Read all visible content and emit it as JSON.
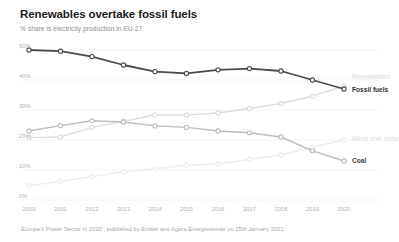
{
  "header": {
    "title": "Renewables overtake fossil fuels",
    "subtitle": "% share is electricity production in EU-27"
  },
  "footnote": {
    "text": "‚Europe's Power Sector in 2020“, published by Ember and Agora Energiewende on 25th January 2021."
  },
  "labels": {
    "fossil": "Fossil fuels",
    "coal": "Coal",
    "renewables": "Renewables",
    "wind_solar": "Wind and solar"
  },
  "colors": {
    "fossil": "#4a4a4a",
    "coal": "#bdbdbd",
    "renewables": "#dcdcdc",
    "wind_solar": "#ececec",
    "grid": "#f0f0f0",
    "axis_text": "#b2b2b2",
    "title": "#1b1b1b",
    "subtitle": "#8e8e8e"
  },
  "chart_data": {
    "type": "line",
    "title": "Renewables overtake fossil fuels",
    "subtitle": "% share is electricity production in EU-27",
    "xlabel": "",
    "ylabel": "% share is electricity production in EU-27",
    "x": [
      "2010",
      "2011",
      "2012",
      "2013",
      "2014",
      "2015",
      "2016",
      "2017",
      "2018",
      "2019",
      "2020"
    ],
    "ylim": [
      0,
      50
    ],
    "yticks": [
      0,
      10,
      20,
      30,
      40,
      50
    ],
    "ytick_labels": [
      "0%",
      "10%",
      "20%",
      "30%",
      "40%",
      "50%"
    ],
    "grid": true,
    "legend": "right-inline",
    "series": [
      {
        "name": "Fossil fuels",
        "color": "#4a4a4a",
        "values": [
          50.0,
          49.6,
          47.8,
          45.0,
          42.8,
          42.2,
          43.4,
          43.8,
          43.0,
          40.0,
          37.0
        ]
      },
      {
        "name": "Renewables",
        "color": "#dcdcdc",
        "values": [
          20.8,
          21.0,
          24.2,
          26.2,
          28.4,
          28.3,
          29.0,
          30.5,
          32.2,
          34.6,
          38.0
        ]
      },
      {
        "name": "Coal",
        "color": "#bdbdbd",
        "values": [
          23.0,
          24.8,
          26.4,
          26.0,
          24.7,
          24.2,
          23.0,
          22.4,
          21.0,
          16.4,
          13.0
        ]
      },
      {
        "name": "Wind and solar",
        "color": "#ececec",
        "values": [
          4.8,
          6.2,
          7.8,
          9.4,
          10.4,
          11.6,
          12.0,
          13.6,
          15.0,
          17.6,
          20.0
        ]
      }
    ]
  }
}
